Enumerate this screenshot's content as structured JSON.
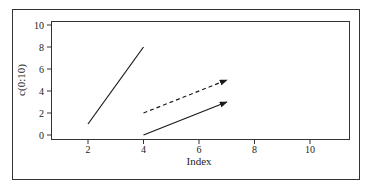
{
  "chart_data": {
    "type": "line",
    "title": "",
    "xlabel": "Index",
    "ylabel": "c(0:10)",
    "xlim": [
      0.9,
      11.6
    ],
    "ylim": [
      -0.4,
      10.4
    ],
    "x_ticks": [
      2,
      4,
      6,
      8,
      10
    ],
    "y_ticks": [
      0,
      2,
      4,
      6,
      8,
      10
    ],
    "grid": false,
    "legend": null,
    "series": [
      {
        "name": "segment",
        "style": "solid",
        "arrow": false,
        "x": [
          2,
          4
        ],
        "y": [
          1,
          8
        ]
      },
      {
        "name": "dashed-arrow",
        "style": "dashed",
        "arrow": true,
        "x": [
          4,
          7
        ],
        "y": [
          2,
          5
        ]
      },
      {
        "name": "solid-arrow",
        "style": "solid",
        "arrow": true,
        "x": [
          4,
          7
        ],
        "y": [
          0,
          3
        ]
      }
    ]
  },
  "colors": {
    "line": "#1a1a1a",
    "frame": "#333333",
    "background": "#ffffff"
  }
}
